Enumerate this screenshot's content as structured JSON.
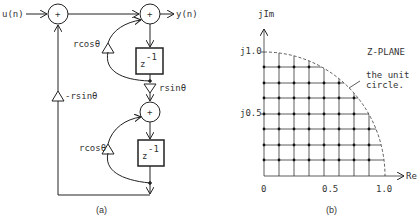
{
  "panel_a": {
    "caption": "(a)",
    "input_label": "u(n)",
    "output_label": "y(n)",
    "adder_symbol": "+",
    "delay_label_base": "z",
    "delay_label_exp": "-1",
    "gain_rcos_top": "rcosθ",
    "gain_rcos_bottom": "rcosθ",
    "gain_rsin": "rsinθ",
    "gain_neg_rsin": "-rsinθ"
  },
  "panel_b": {
    "caption": "(b)",
    "title": "Z-PLANE",
    "y_axis_label": "jIm",
    "x_axis_label": "Re",
    "y_ticks": [
      "j1.0",
      "j0.5"
    ],
    "x_ticks": [
      "0",
      "0.5",
      "1.0"
    ],
    "annotation_line1": "the unit",
    "annotation_line2": "circle.",
    "grid_divisions": 8
  },
  "colors": {
    "line": "#222222",
    "text": "#333333",
    "background": "#ffffff"
  }
}
